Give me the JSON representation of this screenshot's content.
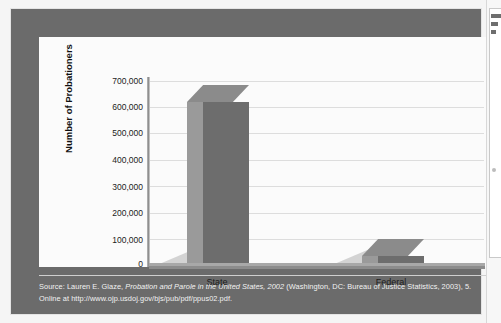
{
  "figure": {
    "caption_source_prefix": "Source: Lauren E. Glaze, ",
    "caption_title_italic": "Probation and Parole in the United States, 2002",
    "caption_source_suffix": " (Washington, DC: Bureau of Justice Statistics, 2003), 5.",
    "caption_line2": "Online at http://www.ojp.usdoj.gov/bjs/pub/pdf/ppus02.pdf.",
    "frame_color": "#6b6b6b",
    "panel_color": "#fbfbfb"
  },
  "chart_data": {
    "type": "bar",
    "title": "",
    "subtitle": "",
    "categories": [
      "State",
      "Federal"
    ],
    "values": [
      620000,
      33000
    ],
    "xlabel": "",
    "ylabel": "Number of Probationers",
    "ylim": [
      0,
      700000
    ],
    "ytick_values": [
      700000,
      600000,
      500000,
      400000,
      300000,
      200000,
      100000,
      0
    ],
    "ytick_labels": [
      "700,000",
      "600,000",
      "500,000",
      "400,000",
      "300,000",
      "200,000",
      "100,000",
      "0"
    ],
    "grid": true,
    "grid_axis": "y",
    "legend": false,
    "legend_position": "none",
    "style": "3d-column",
    "series": [
      {
        "name": "Number of Probationers",
        "values": [
          620000,
          33000
        ],
        "bar_front_color": "#6d6d6d",
        "bar_side_color": "#9a9a9a",
        "bar_top_color": "#8b8b8b"
      }
    ]
  }
}
